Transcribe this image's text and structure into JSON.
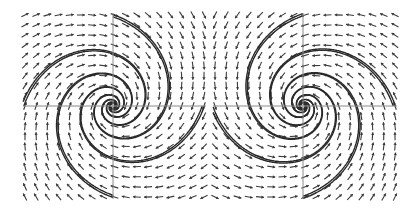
{
  "figure": {
    "width": 411,
    "height": 216,
    "background": "#ffffff",
    "axis_color": "#8a8a8a",
    "arrow_color": "#3a3a3a",
    "trajectory_color": "#2a2a2a",
    "panels": [
      {
        "name": "left-phase-portrait",
        "orientation": "clockwise",
        "x0": 25,
        "x1": 204,
        "y0": 15,
        "y1": 197,
        "origin": [
          113,
          106
        ],
        "grid_cols": 17,
        "grid_rows": 19,
        "decay": 0.35,
        "trajectory_starts": [
          [
            0.0,
            -1.0
          ],
          [
            0.0,
            1.0
          ],
          [
            -1.0,
            0.0
          ],
          [
            1.0,
            0.0
          ]
        ]
      },
      {
        "name": "right-phase-portrait",
        "orientation": "counterclockwise",
        "x0": 215,
        "x1": 395,
        "y0": 15,
        "y1": 197,
        "origin": [
          303,
          106
        ],
        "grid_cols": 17,
        "grid_rows": 19,
        "decay": 0.35,
        "trajectory_starts": [
          [
            0.0,
            -1.0
          ],
          [
            0.0,
            1.0
          ],
          [
            -1.0,
            0.0
          ],
          [
            1.0,
            0.0
          ]
        ]
      }
    ]
  },
  "chart_data": [
    {
      "type": "vector-field",
      "title": "",
      "description": "Phase portrait: stable spiral (focus), clockwise rotation",
      "xlabel": "",
      "ylabel": "",
      "grid": false,
      "equilibrium": [
        0,
        0
      ],
      "trajectories": 4
    },
    {
      "type": "vector-field",
      "title": "",
      "description": "Phase portrait: stable spiral (focus), counterclockwise rotation (mirror image)",
      "xlabel": "",
      "ylabel": "",
      "grid": false,
      "equilibrium": [
        0,
        0
      ],
      "trajectories": 4
    }
  ]
}
